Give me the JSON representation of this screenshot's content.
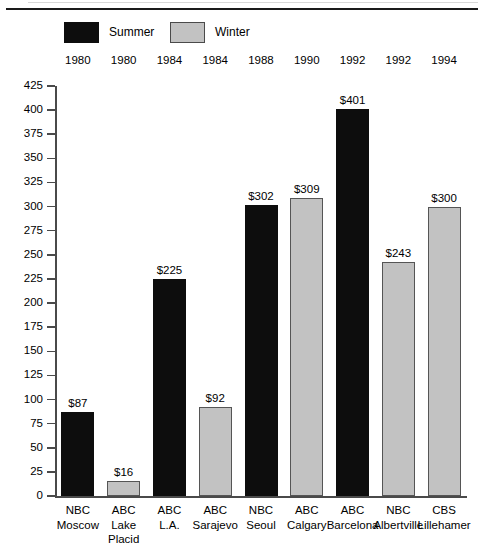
{
  "legend": {
    "items": [
      {
        "label": "Summer",
        "color": "#0d0d0d",
        "swatch_name": "legend-swatch-summer"
      },
      {
        "label": "Winter",
        "color": "#c2c2c2",
        "swatch_name": "legend-swatch-winter"
      }
    ]
  },
  "years": [
    "1980",
    "1980",
    "1984",
    "1984",
    "1988",
    "1990",
    "1992",
    "1992",
    "1994"
  ],
  "y_axis": {
    "ticks": [
      "425",
      "400",
      "375",
      "350",
      "325",
      "300",
      "275",
      "250",
      "225",
      "200",
      "175",
      "150",
      "125",
      "100",
      "75",
      "50",
      "25",
      "0"
    ]
  },
  "x_labels": [
    {
      "line1": "NBC",
      "line2": "Moscow",
      "line3": ""
    },
    {
      "line1": "ABC",
      "line2": "Lake",
      "line3": "Placid"
    },
    {
      "line1": "ABC",
      "line2": "L.A.",
      "line3": ""
    },
    {
      "line1": "ABC",
      "line2": "Sarajevo",
      "line3": ""
    },
    {
      "line1": "NBC",
      "line2": "Seoul",
      "line3": ""
    },
    {
      "line1": "ABC",
      "line2": "Calgary",
      "line3": ""
    },
    {
      "line1": "ABC",
      "line2": "Barcelona",
      "line3": ""
    },
    {
      "line1": "NBC",
      "line2": "Albertville",
      "line3": ""
    },
    {
      "line1": "CBS",
      "line2": "Lillehamer",
      "line3": ""
    }
  ],
  "bar_labels": [
    "$87",
    "$16",
    "$225",
    "$92",
    "$302",
    "$309",
    "$401",
    "$243",
    "$300"
  ],
  "chart_data": {
    "type": "bar",
    "title": "",
    "xlabel": "",
    "ylabel": "",
    "ylim": [
      0,
      425
    ],
    "ytick_step": 25,
    "grid": false,
    "legend_position": "top-left",
    "categories": [
      "NBC Moscow",
      "ABC Lake Placid",
      "ABC L.A.",
      "ABC Sarajevo",
      "NBC Seoul",
      "ABC Calgary",
      "ABC Barcelona",
      "NBC Albertville",
      "CBS Lillehamer"
    ],
    "years": [
      1980,
      1980,
      1984,
      1984,
      1988,
      1990,
      1992,
      1992,
      1994
    ],
    "values": [
      87,
      16,
      225,
      92,
      302,
      309,
      401,
      243,
      300
    ],
    "value_labels": [
      "$87",
      "$16",
      "$225",
      "$92",
      "$302",
      "$309",
      "$401",
      "$243",
      "$300"
    ],
    "season": [
      "Summer",
      "Winter",
      "Summer",
      "Winter",
      "Summer",
      "Winter",
      "Summer",
      "Winter",
      "Winter"
    ],
    "series": [
      {
        "name": "Summer",
        "color": "#0d0d0d",
        "points": [
          {
            "category": "NBC Moscow",
            "year": 1980,
            "value": 87
          },
          {
            "category": "ABC L.A.",
            "year": 1984,
            "value": 225
          },
          {
            "category": "NBC Seoul",
            "year": 1988,
            "value": 302
          },
          {
            "category": "ABC Barcelona",
            "year": 1992,
            "value": 401
          }
        ]
      },
      {
        "name": "Winter",
        "color": "#c2c2c2",
        "points": [
          {
            "category": "ABC Lake Placid",
            "year": 1980,
            "value": 16
          },
          {
            "category": "ABC Sarajevo",
            "year": 1984,
            "value": 92
          },
          {
            "category": "ABC Calgary",
            "year": 1990,
            "value": 309
          },
          {
            "category": "NBC Albertville",
            "year": 1992,
            "value": 243
          },
          {
            "category": "CBS Lillehamer",
            "year": 1994,
            "value": 300
          }
        ]
      }
    ]
  }
}
